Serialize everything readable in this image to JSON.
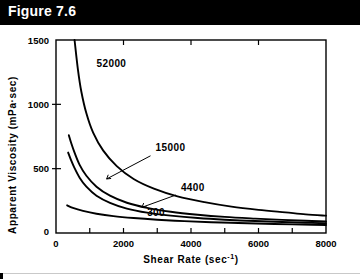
{
  "title": {
    "label": "Figure 7.6"
  },
  "chart_data": {
    "type": "line",
    "title": "",
    "xlabel": "Shear Rate (sec",
    "xlabel_exponent": "-1",
    "xlabel_close": ")",
    "ylabel": "Apparent Viscosity (mPa·sec)",
    "xlim": [
      0,
      8000
    ],
    "ylim": [
      0,
      1500
    ],
    "xticks": [
      0,
      1000,
      2000,
      3000,
      4000,
      5000,
      6000,
      7000,
      8000
    ],
    "xtick_labels": [
      "0",
      "",
      "2000",
      "",
      "4000",
      "",
      "6000",
      "",
      "8000"
    ],
    "yticks": [
      0,
      500,
      1000,
      1500
    ],
    "ytick_labels": [
      "0",
      "500",
      "1000",
      "1500"
    ],
    "grid": false,
    "legend_position": "inline-annotations",
    "series": [
      {
        "name": "52000",
        "label": "52000",
        "label_x": 1200,
        "label_y": 1290,
        "leader": false,
        "x": [
          550,
          650,
          750,
          900,
          1100,
          1400,
          1800,
          2300,
          2900,
          3600,
          4400,
          5200,
          6000,
          6800,
          7400,
          8000
        ],
        "y": [
          1500,
          1270,
          1100,
          930,
          780,
          640,
          520,
          420,
          345,
          285,
          240,
          205,
          180,
          160,
          145,
          135
        ]
      },
      {
        "name": "15000",
        "label": "15000",
        "label_x": 2950,
        "label_y": 640,
        "leader": true,
        "leader_x1": 2800,
        "leader_y1": 600,
        "leader_x2": 1500,
        "leader_y2": 420,
        "x": [
          380,
          450,
          550,
          700,
          900,
          1200,
          1600,
          2100,
          2700,
          3400,
          4200,
          5000,
          5900,
          6700,
          7400,
          8000
        ],
        "y": [
          760,
          700,
          625,
          530,
          445,
          360,
          290,
          235,
          195,
          165,
          142,
          125,
          112,
          102,
          95,
          90
        ]
      },
      {
        "name": "4400",
        "label": "4400",
        "label_x": 3700,
        "label_y": 330,
        "leader": true,
        "leader_x1": 3550,
        "leader_y1": 295,
        "leader_x2": 2550,
        "leader_y2": 200,
        "x": [
          360,
          440,
          540,
          700,
          900,
          1200,
          1600,
          2100,
          2700,
          3400,
          4200,
          5000,
          5900,
          6700,
          7400,
          8000
        ],
        "y": [
          625,
          570,
          510,
          430,
          360,
          290,
          235,
          190,
          158,
          135,
          116,
          103,
          93,
          85,
          80,
          76
        ]
      },
      {
        "name": "300",
        "label": "300",
        "label_x": 2700,
        "label_y": 130,
        "leader": false,
        "x": [
          330,
          500,
          800,
          1200,
          1700,
          2300,
          3000,
          3800,
          4600,
          5400,
          6200,
          7000,
          7600,
          8000
        ],
        "y": [
          215,
          195,
          172,
          150,
          131,
          116,
          103,
          92,
          84,
          78,
          72,
          67,
          64,
          62
        ]
      }
    ]
  }
}
